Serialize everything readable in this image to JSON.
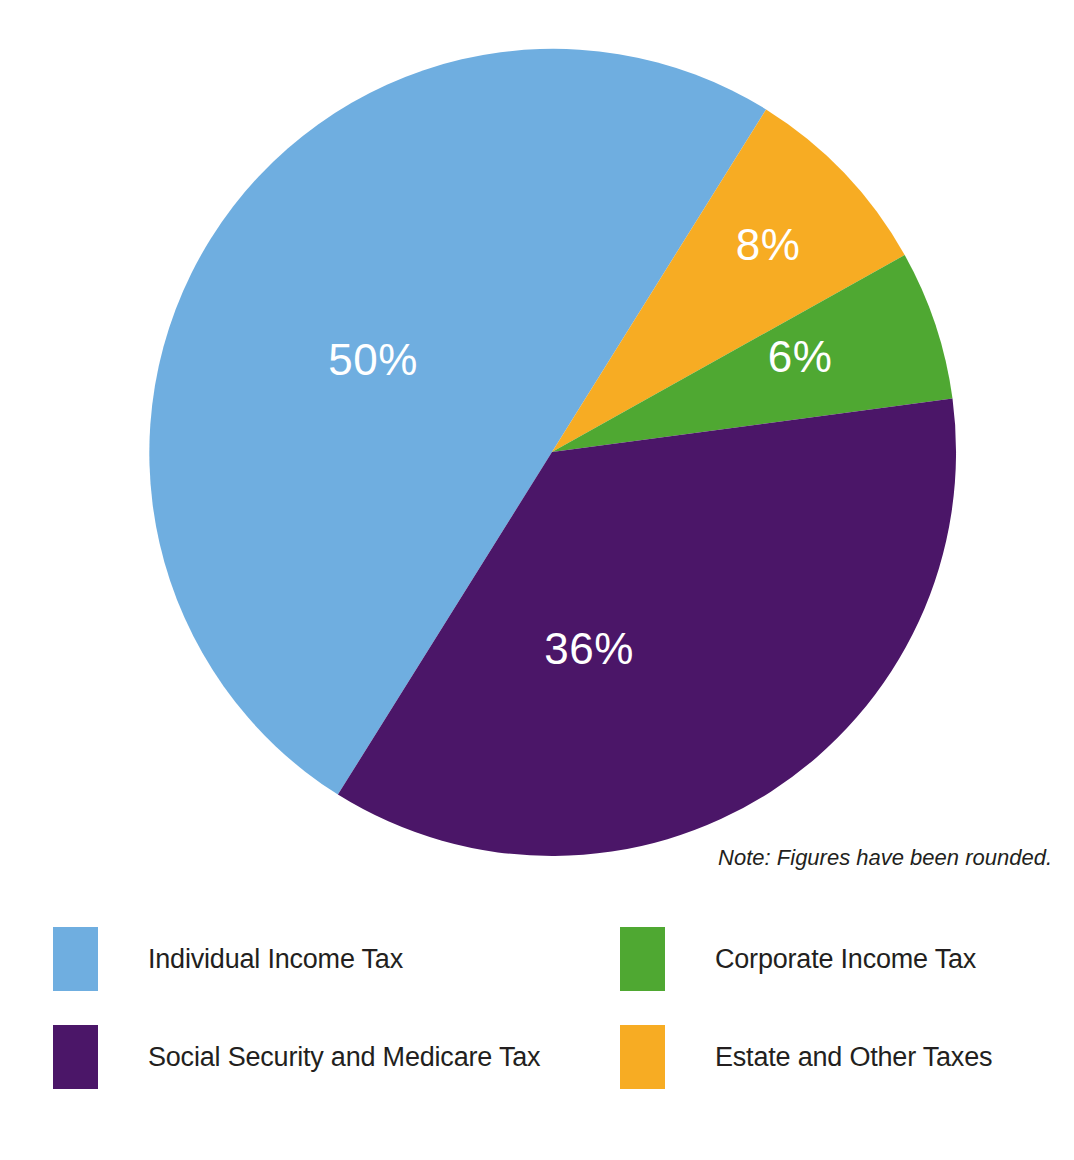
{
  "chart_data": {
    "type": "pie",
    "title": "",
    "subtitle": "",
    "categories": [
      "Individual Income Tax",
      "Social Security and Medicare Tax",
      "Corporate Income Tax",
      "Estate and Other Taxes"
    ],
    "values": [
      50,
      36,
      6,
      8
    ],
    "value_labels": [
      "50%",
      "36%",
      "6%",
      "8%"
    ],
    "unit": "percent",
    "colors": [
      "#6FAEE0",
      "#4B1668",
      "#4FA832",
      "#F7AC23"
    ],
    "legend_position": "bottom",
    "grid": false,
    "annotations": [
      "Note: Figures have been rounded."
    ],
    "slices": [
      {
        "key": "individual-income-tax",
        "label": "Individual Income Tax",
        "value": 50,
        "value_label": "50%",
        "color": "#6FAEE0"
      },
      {
        "key": "social-security-medicare-tax",
        "label": "Social Security and Medicare Tax",
        "value": 36,
        "value_label": "36%",
        "color": "#4B1668"
      },
      {
        "key": "corporate-income-tax",
        "label": "Corporate Income Tax",
        "value": 6,
        "value_label": "6%",
        "color": "#4FA832"
      },
      {
        "key": "estate-and-other-taxes",
        "label": "Estate and Other Taxes",
        "value": 8,
        "value_label": "8%",
        "color": "#F7AC23"
      }
    ]
  },
  "note": {
    "text": "Note: Figures have been rounded."
  },
  "labels": {
    "individual": "50%",
    "social": "36%",
    "corporate": "6%",
    "estate": "8%"
  },
  "legend": {
    "items": [
      {
        "label": "Individual Income Tax",
        "color": "#6FAEE0"
      },
      {
        "label": "Corporate Income Tax",
        "color": "#4FA832"
      },
      {
        "label": "Social Security and Medicare Tax",
        "color": "#4B1668"
      },
      {
        "label": "Estate and Other Taxes",
        "color": "#F7AC23"
      }
    ]
  }
}
